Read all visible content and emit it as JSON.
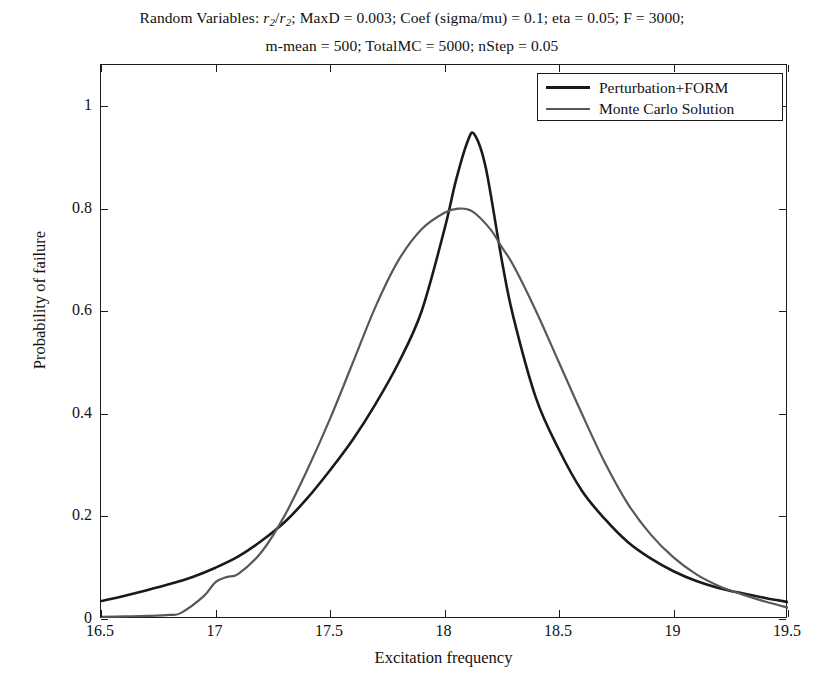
{
  "title": {
    "line1_prefix": "Random Variables: ",
    "line1_var_num": "r",
    "line1_var_sub": "2",
    "line1_slash": "/",
    "line1_var2_num": "r",
    "line1_var2_sub": "2",
    "line1_rest": "; MaxD = 0.003; Coef (sigma/mu) = 0.1; eta = 0.05; F = 3000;",
    "line2": "m-mean = 500; TotalMC = 5000; nStep = 0.05"
  },
  "axes": {
    "x_title": "Excitation frequency",
    "y_title": "Probability of failure",
    "x_ticks": [
      "16.5",
      "17",
      "17.5",
      "18",
      "18.5",
      "19",
      "19.5"
    ],
    "y_ticks": [
      "0",
      "0.2",
      "0.4",
      "0.6",
      "0.8",
      "1"
    ]
  },
  "legend": {
    "position": "top-right",
    "entries": [
      {
        "label": "Perturbation+FORM",
        "color": "#1a1a1a",
        "width": 2.6
      },
      {
        "label": "Monte Carlo Solution",
        "color": "#585858",
        "width": 2.2
      }
    ]
  },
  "chart_data": {
    "type": "line",
    "title": "Random Variables: r2/r2; MaxD = 0.003; Coef (sigma/mu) = 0.1; eta = 0.05; F = 3000; m-mean = 500; TotalMC = 5000; nStep = 0.05",
    "xlabel": "Excitation frequency",
    "ylabel": "Probability of failure",
    "xlim": [
      16.5,
      19.5
    ],
    "ylim": [
      0,
      1.08
    ],
    "xticks": [
      16.5,
      17,
      17.5,
      18,
      18.5,
      19,
      19.5
    ],
    "yticks": [
      0,
      0.2,
      0.4,
      0.6,
      0.8,
      1
    ],
    "grid": false,
    "legend_position": "upper right",
    "series": [
      {
        "name": "Perturbation+FORM",
        "color": "#1a1a1a",
        "x": [
          16.5,
          16.6,
          16.7,
          16.8,
          16.9,
          17.0,
          17.1,
          17.2,
          17.3,
          17.4,
          17.5,
          17.6,
          17.7,
          17.8,
          17.9,
          18.0,
          18.05,
          18.1,
          18.13,
          18.18,
          18.25,
          18.3,
          18.4,
          18.5,
          18.6,
          18.7,
          18.8,
          18.9,
          19.0,
          19.1,
          19.2,
          19.3,
          19.4,
          19.5
        ],
        "y": [
          0.035,
          0.045,
          0.056,
          0.068,
          0.082,
          0.1,
          0.122,
          0.152,
          0.188,
          0.235,
          0.29,
          0.35,
          0.42,
          0.5,
          0.6,
          0.76,
          0.855,
          0.93,
          0.945,
          0.88,
          0.7,
          0.59,
          0.43,
          0.33,
          0.25,
          0.195,
          0.15,
          0.118,
          0.093,
          0.074,
          0.06,
          0.05,
          0.041,
          0.033
        ]
      },
      {
        "name": "Monte Carlo Solution",
        "color": "#585858",
        "x": [
          16.5,
          16.6,
          16.7,
          16.8,
          16.85,
          16.95,
          17.0,
          17.05,
          17.1,
          17.2,
          17.3,
          17.4,
          17.5,
          17.6,
          17.7,
          17.8,
          17.9,
          18.0,
          18.06,
          18.12,
          18.2,
          18.25,
          18.3,
          18.4,
          18.5,
          18.6,
          18.7,
          18.8,
          18.9,
          19.0,
          19.1,
          19.2,
          19.3,
          19.4,
          19.5
        ],
        "y": [
          0.004,
          0.005,
          0.006,
          0.008,
          0.012,
          0.045,
          0.072,
          0.082,
          0.088,
          0.13,
          0.2,
          0.29,
          0.39,
          0.5,
          0.61,
          0.7,
          0.76,
          0.792,
          0.8,
          0.795,
          0.76,
          0.725,
          0.69,
          0.6,
          0.5,
          0.4,
          0.305,
          0.225,
          0.165,
          0.12,
          0.087,
          0.064,
          0.048,
          0.034,
          0.022
        ]
      }
    ],
    "annotations": [
      {
        "text": "Perturbation+FORM peak",
        "x": 18.13,
        "y": 0.945
      },
      {
        "text": "Monte Carlo peak",
        "x": 18.06,
        "y": 0.8
      }
    ]
  }
}
